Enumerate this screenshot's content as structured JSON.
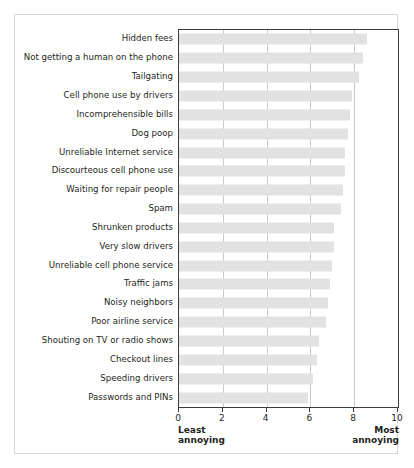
{
  "chart_data": {
    "type": "bar",
    "orientation": "horizontal",
    "title": "",
    "subtitle": "",
    "xlabel": "",
    "ylabel": "",
    "xlim": [
      0,
      10
    ],
    "xticks": [
      0,
      2,
      4,
      6,
      8,
      10
    ],
    "xticklabels": [
      "0",
      "2",
      "4",
      "6",
      "8",
      "10"
    ],
    "grid": true,
    "grid_axis": "x",
    "legend": false,
    "axis_low_label": "Least annoying",
    "axis_high_label": "Most annoying",
    "axis_low_label_line1": "Least",
    "axis_low_label_line2": "annoying",
    "axis_high_label_line1": "Most",
    "axis_high_label_line2": "annoying",
    "bar_color": "#e2e2e2",
    "axis_color": "#3c3c3c",
    "grid_color": "#c9c9c9",
    "categories": [
      "Hidden fees",
      "Not getting a human on the phone",
      "Tailgating",
      "Cell phone use by drivers",
      "Incomprehensible bills",
      "Dog poop",
      "Unreliable Internet service",
      "Discourteous cell phone use",
      "Waiting for repair people",
      "Spam",
      "Shrunken products",
      "Very slow drivers",
      "Unreliable cell phone service",
      "Traffic jams",
      "Noisy neighbors",
      "Poor airline service",
      "Shouting on TV or radio shows",
      "Checkout lines",
      "Speeding drivers",
      "Passwords and PINs"
    ],
    "values": [
      8.6,
      8.4,
      8.2,
      7.9,
      7.8,
      7.7,
      7.6,
      7.6,
      7.5,
      7.4,
      7.1,
      7.1,
      7.0,
      6.9,
      6.8,
      6.7,
      6.4,
      6.3,
      6.1,
      5.9
    ]
  }
}
